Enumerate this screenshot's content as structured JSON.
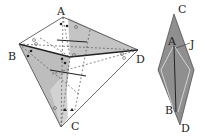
{
  "figure": {
    "left": {
      "labels": {
        "A": "A",
        "B": "B",
        "C": "C",
        "D": "D"
      },
      "shade_color": "#b8b8b8"
    },
    "right": {
      "labels": {
        "C": "C",
        "A": "A",
        "J": "J",
        "B": "B",
        "D": "D"
      },
      "fill_color": "#8f8f8f"
    }
  }
}
